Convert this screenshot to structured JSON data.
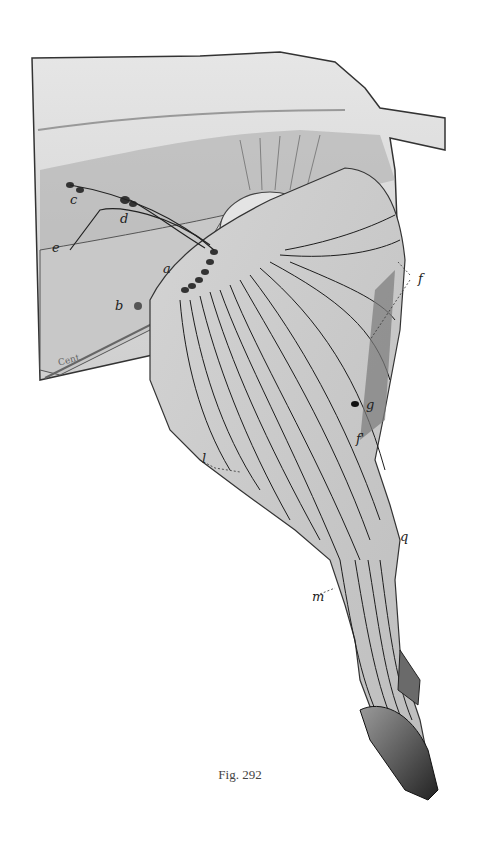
{
  "figure": {
    "caption": "Fig. 292",
    "labels": [
      {
        "id": "a",
        "text": "a",
        "x": 163,
        "y": 272
      },
      {
        "id": "b",
        "text": "b",
        "x": 115,
        "y": 299
      },
      {
        "id": "c",
        "text": "c",
        "x": 70,
        "y": 200
      },
      {
        "id": "d",
        "text": "d",
        "x": 120,
        "y": 215
      },
      {
        "id": "e",
        "text": "e",
        "x": 52,
        "y": 241
      },
      {
        "id": "f1",
        "text": "f",
        "x": 418,
        "y": 274
      },
      {
        "id": "f2",
        "text": "f'",
        "x": 356,
        "y": 432
      },
      {
        "id": "g",
        "text": "g",
        "x": 366,
        "y": 400
      },
      {
        "id": "l",
        "text": "l",
        "x": 202,
        "y": 455
      },
      {
        "id": "q",
        "text": "q",
        "x": 400,
        "y": 532
      },
      {
        "id": "m",
        "text": "m",
        "x": 315,
        "y": 592
      }
    ],
    "corner_text": "Cent"
  }
}
